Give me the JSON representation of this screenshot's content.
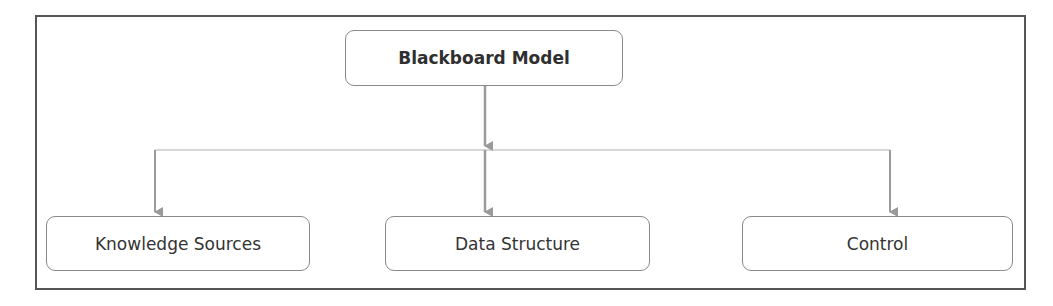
{
  "diagram": {
    "root": {
      "label": "Blackboard Model"
    },
    "children": [
      {
        "label": "Knowledge Sources"
      },
      {
        "label": "Data Structure"
      },
      {
        "label": "Control"
      }
    ],
    "colors": {
      "frame": "#555555",
      "box_border": "#8a8a8a",
      "connector": "#9a9a9a",
      "text": "#333333"
    }
  }
}
